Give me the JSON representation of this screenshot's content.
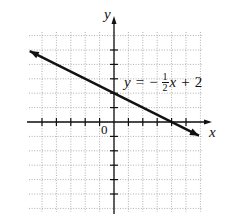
{
  "chart_data": {
    "type": "line",
    "title": "",
    "xlabel": "x",
    "ylabel": "y",
    "origin_label": "0",
    "equation": {
      "lhs": "y",
      "equals": "=",
      "sign": "−",
      "frac_num": "1",
      "frac_den": "2",
      "var": "x",
      "plus": "+",
      "const": "2"
    },
    "series": [
      {
        "name": "y = -1/2 x + 2",
        "slope": -0.5,
        "intercept": 2,
        "x": [
          -6,
          6
        ],
        "y": [
          5,
          -1
        ],
        "arrows": "both"
      }
    ],
    "xlim": [
      -6,
      6
    ],
    "ylim": [
      -6,
      6
    ],
    "x_ticks": [
      -5,
      -4,
      -3,
      -2,
      -1,
      1,
      2,
      3,
      4,
      5
    ],
    "y_ticks": [
      -5,
      -4,
      -3,
      -2,
      -1,
      1,
      2,
      3,
      4,
      5
    ],
    "grid": true,
    "grid_style": "dotted",
    "key_points": [
      {
        "x": 0,
        "y": 2,
        "label": "y-intercept"
      },
      {
        "x": 4,
        "y": 0,
        "label": "x-intercept"
      }
    ]
  },
  "colors": {
    "axis": "#111111",
    "line": "#111111",
    "grid": "#9a9a9a",
    "background": "#ffffff"
  }
}
